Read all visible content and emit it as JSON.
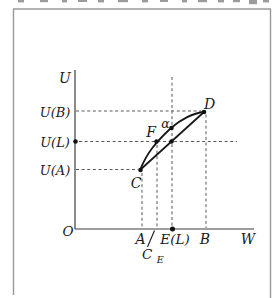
{
  "colors": {
    "ink": "#1a1a1a",
    "curve": "#161616",
    "dashed_line": "#585858",
    "axis": "#3d3d3d",
    "frame_border": "#9a9a9a",
    "background": "#ffffff"
  },
  "axes": {
    "y_label": "U",
    "x_label": "W",
    "origin": "O"
  },
  "y_ticks": [
    {
      "label": "U(B)"
    },
    {
      "label": "U(L)"
    },
    {
      "label": "U(A)"
    }
  ],
  "x_ticks": [
    {
      "label": "A"
    },
    {
      "label": "E(L)"
    },
    {
      "label": "B"
    }
  ],
  "x_tick_subscripted": {
    "base": "C",
    "sub": "E"
  },
  "points": [
    {
      "label": "C"
    },
    {
      "label": "F"
    },
    {
      "label": "α"
    },
    {
      "label": "D"
    }
  ]
}
